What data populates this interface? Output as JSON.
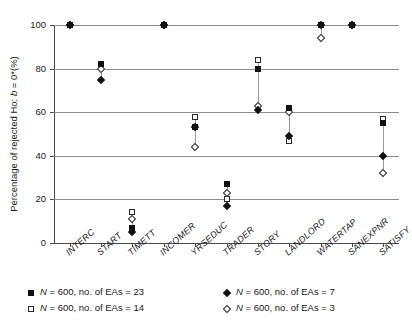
{
  "chart_data": {
    "type": "scatter",
    "title": "",
    "xlabel": "",
    "ylabel": "Percentage of rejected Ho: b = 0*(%)",
    "ylim": [
      0,
      100
    ],
    "yticks": [
      0,
      20,
      40,
      60,
      80,
      100
    ],
    "grid": true,
    "legend_position": "bottom",
    "categories": [
      "INTERC",
      "START",
      "TIMETT",
      "INCOMER",
      "YRSEDUC",
      "TRADER",
      "STORY",
      "LANDLORD",
      "WATERTAP",
      "SANEXPNR",
      "SATISFY"
    ],
    "series": [
      {
        "name": "N = 600, no. of EAs = 23",
        "marker": "filled-square",
        "values": [
          100,
          82,
          7,
          100,
          53,
          27,
          80,
          62,
          100,
          100,
          55
        ]
      },
      {
        "name": "N = 600, no. of EAs = 14",
        "marker": "open-square",
        "values": [
          100,
          82,
          14,
          100,
          58,
          20,
          84,
          47,
          100,
          100,
          57
        ]
      },
      {
        "name": "N = 600, no. of EAs = 7",
        "marker": "filled-diamond",
        "values": [
          100,
          75,
          5,
          100,
          53,
          17,
          61,
          49,
          100,
          100,
          40
        ]
      },
      {
        "name": "N = 600, no. of EAs = 3",
        "marker": "open-diamond",
        "values": [
          100,
          80,
          11,
          100,
          44,
          23,
          63,
          60,
          94,
          100,
          32
        ]
      }
    ]
  },
  "axis": {
    "y_tick_labels": [
      "0",
      "20",
      "40",
      "60",
      "80",
      "100"
    ],
    "y_axis_title": "Percentage of rejected Ho: b = 0*(%)",
    "x_tick_labels": [
      "INTERC",
      "START",
      "TIMETT",
      "INCOMER",
      "YRSEDUC",
      "TRADER",
      "STORY",
      "LANDLORD",
      "WATERTAP",
      "SANEXPNR",
      "SATISFY"
    ]
  },
  "legend": {
    "entries": [
      {
        "label": "N = 600, no. of EAs = 23",
        "marker": "filled-square"
      },
      {
        "label": "N = 600, no. of EAs = 14",
        "marker": "open-square"
      },
      {
        "label": "N = 600, no. of EAs = 7",
        "marker": "filled-diamond"
      },
      {
        "label": "N = 600, no. of EAs = 3",
        "marker": "open-diamond"
      }
    ]
  },
  "colors": {
    "marker_fill": "#111111",
    "marker_stroke": "#2a2a2a",
    "gridline": "#8c8c8c",
    "axis": "#4a4a4a",
    "background": "#ffffff"
  }
}
